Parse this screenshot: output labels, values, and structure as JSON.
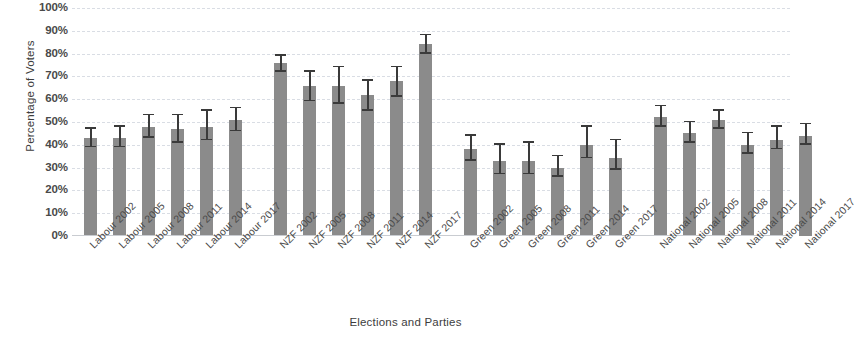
{
  "chart_data": {
    "type": "bar",
    "title": "",
    "xlabel": "Elections and Parties",
    "ylabel": "Percentage of Voters",
    "ylim": [
      0,
      100
    ],
    "y_tick_labels": [
      "100%",
      "90%",
      "80%",
      "70%",
      "60%",
      "50%",
      "40%",
      "30%",
      "20%",
      "10%",
      "0%"
    ],
    "y_tick_values": [
      100,
      90,
      80,
      70,
      60,
      50,
      40,
      30,
      20,
      10,
      0
    ],
    "grid": true,
    "legend": "none",
    "bar_color": "#8b8b8b",
    "error_bar_color": "#3a3a3a",
    "grid_color": "#d9dde4",
    "error_bars": "yes",
    "groups": [
      {
        "name": "Labour",
        "categories": [
          "Labour 2002",
          "Labour 2005",
          "Labour 2008",
          "Labour 2011",
          "Labour 2014",
          "Labour 2017"
        ],
        "values": [
          43,
          43,
          48,
          47,
          48,
          51
        ],
        "err_low": [
          39,
          39,
          43,
          41,
          42,
          46
        ],
        "err_high": [
          47,
          48,
          53,
          53,
          55,
          56
        ]
      },
      {
        "name": "NZF",
        "categories": [
          "NZF 2002",
          "NZF 2005",
          "NZF 2008",
          "NZF 2011",
          "NZF 2014",
          "NZF 2017"
        ],
        "values": [
          76,
          66,
          66,
          62,
          68,
          84
        ],
        "err_low": [
          72,
          59,
          58,
          55,
          61,
          80
        ],
        "err_high": [
          79,
          72,
          74,
          68,
          74,
          88
        ]
      },
      {
        "name": "Green",
        "categories": [
          "Green 2002",
          "Green 2005",
          "Green 2008",
          "Green 2011",
          "Green 2014",
          "Green 2017"
        ],
        "values": [
          38,
          33,
          33,
          30,
          40,
          34
        ],
        "err_low": [
          33,
          27,
          27,
          26,
          34,
          29
        ],
        "err_high": [
          44,
          40,
          41,
          35,
          48,
          42
        ]
      },
      {
        "name": "National",
        "categories": [
          "National 2002",
          "National 2005",
          "National 2008",
          "National 2011",
          "National 2014",
          "National 2017"
        ],
        "values": [
          52,
          45,
          51,
          40,
          42,
          44
        ],
        "err_low": [
          48,
          41,
          47,
          36,
          38,
          40
        ],
        "err_high": [
          57,
          50,
          55,
          45,
          48,
          49
        ]
      }
    ]
  }
}
